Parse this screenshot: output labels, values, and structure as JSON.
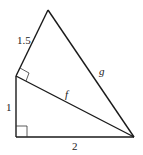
{
  "diagram": {
    "type": "geometry",
    "vertices": {
      "top": [
        48,
        10
      ],
      "mid_left": [
        16,
        76
      ],
      "bottom_left": [
        16,
        137
      ],
      "bottom_right": [
        134,
        137
      ]
    },
    "labels": {
      "side_top_left": "1.5",
      "side_left": "1",
      "side_bottom": "2",
      "diagonal": "f",
      "hypotenuse_outer": "g"
    },
    "right_angles": [
      "bottom_left",
      "mid_left"
    ],
    "stroke_color": "#1a1a1a"
  }
}
